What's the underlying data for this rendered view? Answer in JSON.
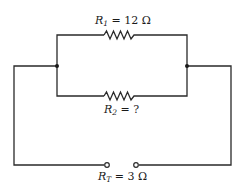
{
  "diagram": {
    "type": "parallel-resistor-circuit",
    "resistors": [
      {
        "id": "R1",
        "symbol": "R",
        "subscript": "1",
        "value_text": " = 12 Ω",
        "position": "top-branch"
      },
      {
        "id": "R2",
        "symbol": "R",
        "subscript": "2",
        "value_text": " = ?",
        "position": "bottom-branch"
      }
    ],
    "total": {
      "id": "RT",
      "symbol": "R",
      "subscript": "T",
      "value_text": " = 3 Ω",
      "position": "terminals"
    },
    "junctions": [
      "left-node",
      "right-node"
    ],
    "terminals": [
      "left-terminal",
      "right-terminal"
    ],
    "colors": {
      "line": "#2a2a2a",
      "background": "#ffffff"
    }
  }
}
